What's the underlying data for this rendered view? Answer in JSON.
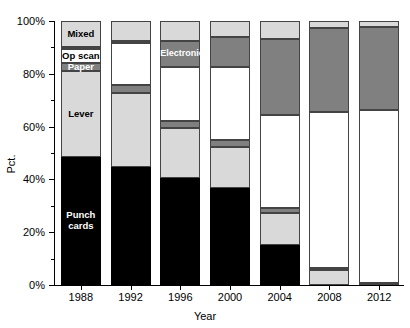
{
  "chart_data": {
    "type": "bar",
    "subtype": "stacked-bar-100pct",
    "title": "",
    "xlabel": "Year",
    "ylabel": "Pct.",
    "categories": [
      "1988",
      "1992",
      "1996",
      "2000",
      "2004",
      "2008",
      "2012"
    ],
    "ylim": [
      0,
      100
    ],
    "ytick_labels": [
      "0%",
      "20%",
      "40%",
      "60%",
      "80%",
      "100%"
    ],
    "ytick_values": [
      0,
      20,
      40,
      60,
      80,
      100
    ],
    "yminor_values": [
      10,
      30,
      50,
      70,
      90
    ],
    "grid": false,
    "legend": "inline-segment-labels",
    "series": [
      {
        "name": "Punch cards",
        "color": "#000000",
        "text_color": "#ffffff",
        "values": [
          48.5,
          44.7,
          40.5,
          36.7,
          15.2,
          0,
          0
        ]
      },
      {
        "name": "Lever",
        "color": "#d9d9d9",
        "text_color": "#000000",
        "values": [
          32.6,
          28.0,
          18.9,
          15.5,
          12.1,
          5.7,
          0
        ]
      },
      {
        "name": "Paper",
        "color": "#808080",
        "text_color": "#ffffff",
        "values": [
          3.0,
          3.0,
          2.7,
          2.7,
          1.9,
          0.8,
          0.8
        ]
      },
      {
        "name": "Op scan",
        "color": "#ffffff",
        "text_color": "#000000",
        "values": [
          5.3,
          15.9,
          20.5,
          27.7,
          35.2,
          59.0,
          65.5
        ]
      },
      {
        "name": "Electronic",
        "color": "#808080",
        "text_color": "#ffffff",
        "values": [
          0.8,
          0.8,
          9.8,
          11.4,
          28.8,
          31.8,
          31.4
        ]
      },
      {
        "name": "Mixed",
        "color": "#d9d9d9",
        "text_color": "#000000",
        "values": [
          9.8,
          7.6,
          7.6,
          6.1,
          6.8,
          2.7,
          2.3
        ]
      }
    ],
    "segment_labels": [
      {
        "series": "Mixed",
        "category": "1988",
        "text": "Mixed"
      },
      {
        "series": "Op scan",
        "category": "1988",
        "text": "Op scan"
      },
      {
        "series": "Paper",
        "category": "1988",
        "text": "Paper"
      },
      {
        "series": "Lever",
        "category": "1988",
        "text": "Lever"
      },
      {
        "series": "Punch cards",
        "category": "1988",
        "text": "Punch\ncards"
      },
      {
        "series": "Electronic",
        "category": "1996",
        "text": "Electronic"
      }
    ]
  }
}
